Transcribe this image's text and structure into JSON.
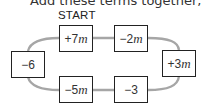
{
  "heading": "Add these terms together, moving c",
  "start_label": "START",
  "line_color": "#a6a6a6",
  "terms": [
    {
      "position": "top-left",
      "sign": "+",
      "coef": "7",
      "var": "m"
    },
    {
      "position": "top-right",
      "sign": "−",
      "coef": "2",
      "var": "m"
    },
    {
      "position": "right",
      "sign": "+",
      "coef": "3",
      "var": "m"
    },
    {
      "position": "bottom-right",
      "sign": "−",
      "coef": "3",
      "var": ""
    },
    {
      "position": "bottom-left",
      "sign": "−",
      "coef": "5",
      "var": "m"
    },
    {
      "position": "left",
      "sign": "−",
      "coef": "6",
      "var": ""
    }
  ]
}
